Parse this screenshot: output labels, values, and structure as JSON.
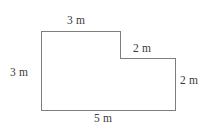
{
  "figure": {
    "kind": "composite-rectilinear-polygon",
    "shape_name": "L-shaped step figure",
    "units": "m",
    "stroke_color": "#7d7d7d",
    "fill_color": "#ffffff",
    "background_color": "#ffffff",
    "text_color": "#3b3b3b",
    "stroke_width": 1,
    "vertices": [
      {
        "id": "top-left",
        "x": 41,
        "y": 31
      },
      {
        "id": "top-right-upper",
        "x": 120,
        "y": 31
      },
      {
        "id": "step-inner-corner",
        "x": 120,
        "y": 58
      },
      {
        "id": "top-right-lower",
        "x": 175,
        "y": 58
      },
      {
        "id": "bottom-right",
        "x": 175,
        "y": 110
      },
      {
        "id": "bottom-left",
        "x": 41,
        "y": 110
      }
    ],
    "path": "M41,31 L120,31 L120,58 L175,58 L175,110 L41,110 Z",
    "edges": [
      {
        "id": "top-upper",
        "label": "3 m",
        "value": 3,
        "orientation": "horizontal",
        "from": "top-left",
        "to": "top-right-upper"
      },
      {
        "id": "step-down",
        "label": "",
        "value": null,
        "orientation": "vertical",
        "from": "top-right-upper",
        "to": "step-inner-corner"
      },
      {
        "id": "top-lower",
        "label": "2 m",
        "value": 2,
        "orientation": "horizontal",
        "from": "step-inner-corner",
        "to": "top-right-lower"
      },
      {
        "id": "right",
        "label": "2 m",
        "value": 2,
        "orientation": "vertical",
        "from": "top-right-lower",
        "to": "bottom-right"
      },
      {
        "id": "bottom",
        "label": "5 m",
        "value": 5,
        "orientation": "horizontal",
        "from": "bottom-right",
        "to": "bottom-left"
      },
      {
        "id": "left",
        "label": "3 m",
        "value": 3,
        "orientation": "vertical",
        "from": "bottom-left",
        "to": "top-left"
      }
    ]
  },
  "labels": {
    "top": "3 m",
    "left": "3 m",
    "middle_top": "2 m",
    "right": "2 m",
    "bottom": "5 m"
  }
}
